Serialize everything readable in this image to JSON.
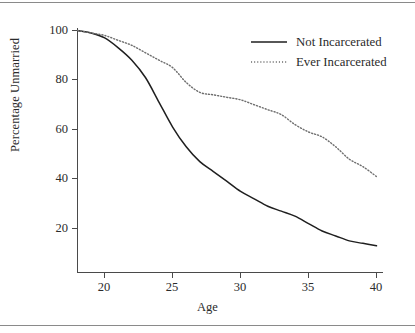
{
  "chart_data": {
    "type": "line",
    "title": "",
    "xlabel": "Age",
    "ylabel": "Percentage Unmarried",
    "xlim": [
      18,
      40
    ],
    "ylim": [
      10,
      102
    ],
    "grid": false,
    "legend_position": "top-right",
    "xticks": [
      20,
      25,
      30,
      35,
      40
    ],
    "yticks": [
      20,
      40,
      60,
      80,
      100
    ],
    "x": [
      18,
      19,
      20,
      21,
      22,
      23,
      24,
      25,
      26,
      27,
      28,
      29,
      30,
      31,
      32,
      33,
      34,
      35,
      36,
      37,
      38,
      39,
      40
    ],
    "series": [
      {
        "name": "Not Incarcerated",
        "style": "solid",
        "color": "#1f1f1f",
        "values": [
          100,
          99,
          97,
          93,
          88,
          81,
          71,
          61,
          53,
          47,
          43,
          39,
          35,
          32,
          29,
          27,
          25,
          22,
          19,
          17,
          15,
          14,
          13
        ]
      },
      {
        "name": "Ever Incarcerated",
        "style": "dotted",
        "color": "#6e6e6e",
        "values": [
          100,
          99,
          98,
          96,
          94,
          91,
          88,
          85,
          79,
          75,
          74,
          73,
          72,
          70,
          68,
          66,
          62,
          59,
          57,
          53,
          48,
          45,
          41
        ]
      }
    ]
  },
  "axes": {
    "ylabel": "Percentage Unmarried",
    "xlabel": "Age",
    "ytick_labels": [
      "100",
      "80",
      "60",
      "40",
      "20"
    ],
    "xtick_labels": [
      "20",
      "25",
      "30",
      "35",
      "40"
    ]
  },
  "legend": {
    "entries": [
      {
        "label": "Not Incarcerated",
        "style": "solid"
      },
      {
        "label": "Ever Incarcerated",
        "style": "dotted"
      }
    ]
  }
}
